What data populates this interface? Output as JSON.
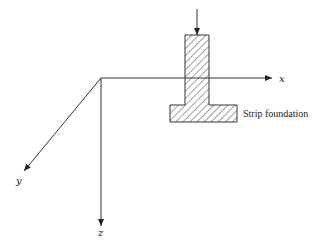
{
  "diagram": {
    "type": "3d-axes-with-strip-foundation",
    "axes": {
      "x": {
        "label": "x"
      },
      "y": {
        "label": "y"
      },
      "z": {
        "label": "z"
      }
    },
    "foundation_label": "Strip foundation",
    "load": {
      "direction": "downward",
      "description": "vertical load arrow on column"
    },
    "colors": {
      "line": "#333333",
      "hatch": "#444444",
      "background": "#ffffff"
    }
  }
}
